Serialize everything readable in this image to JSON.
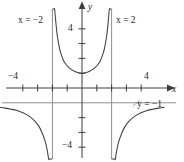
{
  "figure": {
    "name": "rational-function-graph",
    "background": "#ffffff",
    "ink_color": "#231f20",
    "curve_color": "#3f3f3f",
    "asymptote_color": "#8c8c8c"
  },
  "labels": {
    "x_axis": "x",
    "y_axis": "y",
    "asymptote_left": "x = −2",
    "asymptote_right": "x = 2",
    "asymptote_horizontal": "y = −1",
    "tick_x_negative": "−4",
    "tick_x_positive": "4",
    "tick_y_positive": "4",
    "tick_y_negative": "−4"
  },
  "chart_data": {
    "type": "line",
    "title": "",
    "xlabel": "x",
    "ylabel": "y",
    "xlim": [
      -5,
      5
    ],
    "ylim": [
      -5.3,
      5.3
    ],
    "grid": false,
    "legend": "none",
    "axis_arrows": [
      "x-positive",
      "y-positive"
    ],
    "x_ticks": [
      -4,
      -3,
      -2,
      -1,
      1,
      2,
      3,
      4
    ],
    "x_tick_labels": {
      "-4": "−4",
      "4": "4"
    },
    "y_ticks": [
      -4,
      -3,
      -2,
      -1,
      1,
      2,
      3,
      4
    ],
    "y_tick_labels": {
      "4": "4",
      "-4": "−4"
    },
    "origin_pixel": [
      82,
      88
    ],
    "pixels_per_unit": 14.8,
    "annotations": [
      {
        "text": "x = −2",
        "x": -4.3,
        "y": 4.9,
        "kind": "vertical-asymptote-label"
      },
      {
        "text": "x = 2",
        "x": 2.3,
        "y": 4.9,
        "kind": "vertical-asymptote-label"
      },
      {
        "text": "y = −1",
        "x": 3.7,
        "y": -1.3,
        "kind": "horizontal-asymptote-label"
      }
    ],
    "asymptotes": [
      {
        "type": "vertical",
        "value": -2
      },
      {
        "type": "vertical",
        "value": 2
      },
      {
        "type": "horizontal",
        "value": -1
      }
    ],
    "series": [
      {
        "name": "branch-left",
        "comment": "x < -2, decreasing from y=-1 down to -infinity as x -> -2",
        "x": [
          -5.55,
          -5.2,
          -4.8,
          -4.4,
          -4.0,
          -3.6,
          -3.2,
          -2.9,
          -2.7,
          -2.5,
          -2.35,
          -2.25,
          -2.17,
          -2.12,
          -2.08,
          -2.05,
          -2.03
        ],
        "y": [
          -1.31,
          -1.36,
          -1.43,
          -1.52,
          -1.67,
          -1.88,
          -2.22,
          -2.61,
          -3.02,
          -3.56,
          -4.2,
          -4.8,
          -5.5,
          -6.1,
          -6.9,
          -7.6,
          -8.3
        ]
      },
      {
        "name": "branch-middle",
        "comment": "-2 < x < 2, U-shaped with minimum y=1 at x=0",
        "x": [
          -1.97,
          -1.93,
          -1.89,
          -1.85,
          -1.8,
          -1.75,
          -1.68,
          -1.6,
          -1.5,
          -1.4,
          -1.25,
          -1.1,
          -0.9,
          -0.65,
          -0.35,
          0,
          0.35,
          0.65,
          0.9,
          1.1,
          1.25,
          1.4,
          1.5,
          1.6,
          1.68,
          1.75,
          1.8,
          1.85,
          1.89,
          1.93,
          1.97
        ],
        "y": [
          8.3,
          7.1,
          6.2,
          5.5,
          4.8,
          4.25,
          3.6,
          3.1,
          2.6,
          2.25,
          1.86,
          1.62,
          1.4,
          1.21,
          1.06,
          1.0,
          1.06,
          1.21,
          1.4,
          1.62,
          1.86,
          2.25,
          2.6,
          3.1,
          3.6,
          4.25,
          4.8,
          5.5,
          6.2,
          7.1,
          8.3
        ]
      },
      {
        "name": "branch-right",
        "comment": "x > 2, rising from -infinity toward y=-1",
        "x": [
          2.03,
          2.05,
          2.08,
          2.12,
          2.17,
          2.25,
          2.35,
          2.5,
          2.7,
          2.9,
          3.2,
          3.6,
          4.0,
          4.4,
          4.8,
          5.2,
          5.55
        ],
        "y": [
          -8.3,
          -7.6,
          -6.9,
          -6.1,
          -5.5,
          -4.8,
          -4.2,
          -3.56,
          -3.02,
          -2.61,
          -2.22,
          -1.88,
          -1.67,
          -1.52,
          -1.43,
          -1.36,
          -1.31
        ]
      }
    ]
  }
}
